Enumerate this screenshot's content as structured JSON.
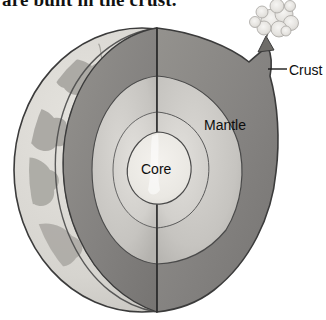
{
  "page": {
    "background_color": "#ffffff",
    "heading_partial": "are built in the crust."
  },
  "figure": {
    "name": "earth-cutaway-diagram",
    "colors": {
      "outline": "#3b3b3b",
      "crust_shell": "#d9d7d2",
      "crust_shell_shadow": "#b9b7b2",
      "mantle_cut_dark": "#8c8c8c",
      "mantle_outer_light": "#c2c1bd",
      "mantle_inner_light": "#d3d2ce",
      "core_fill": "#eceae5",
      "ocean": "#cfcdc8",
      "continent": "#a9a7a2",
      "smoke": "#e8e6e2",
      "volcano_rock": "#6e6c68"
    },
    "labels": {
      "core": "Core",
      "mantle": "Mantle",
      "crust": "Crust"
    },
    "leader_line": {
      "name": "crust-leader-line",
      "from_x": 268,
      "to_x": 287,
      "y": 69
    },
    "volcano": {
      "name": "volcano-eruption",
      "x": 272,
      "y": 22
    },
    "layers": [
      {
        "name": "crust",
        "label": "Crust"
      },
      {
        "name": "mantle",
        "label": "Mantle"
      },
      {
        "name": "core",
        "label": "Core"
      }
    ]
  }
}
